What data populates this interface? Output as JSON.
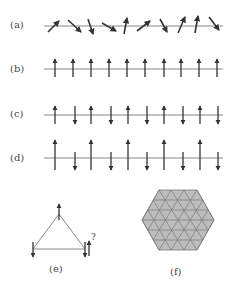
{
  "panels": {
    "a": {
      "label": "(a)",
      "description": "random spin orientations",
      "angles_deg": [
        -35,
        45,
        70,
        35,
        -80,
        -30,
        60,
        -65,
        -80,
        50
      ]
    },
    "b": {
      "label": "(b)",
      "description": "ferromagnetic: all spins up",
      "spins": [
        "up",
        "up",
        "up",
        "up",
        "up",
        "up",
        "up",
        "up",
        "up",
        "up"
      ]
    },
    "c": {
      "label": "(c)",
      "description": "antiferromagnetic: alternating equal spins",
      "spins": [
        "up",
        "down",
        "up",
        "down",
        "up",
        "down",
        "up",
        "down",
        "up",
        "down"
      ]
    },
    "d": {
      "label": "(d)",
      "description": "ferrimagnetic: alternating unequal spins",
      "spins": [
        "up-long",
        "down-short",
        "up-long",
        "down-short",
        "up-long",
        "down-short",
        "up-long",
        "down-short",
        "up-long",
        "down-short"
      ]
    },
    "e": {
      "label": "(e)",
      "description": "geometric frustration on triangle",
      "question_mark": "?"
    },
    "f": {
      "label": "(f)",
      "description": "triangular lattice hexagon"
    }
  },
  "colors": {
    "line": "#888888",
    "arrow": "#333333",
    "hex_fill": "#bdbdbd",
    "hex_stroke": "#777777",
    "text": "#444444"
  }
}
